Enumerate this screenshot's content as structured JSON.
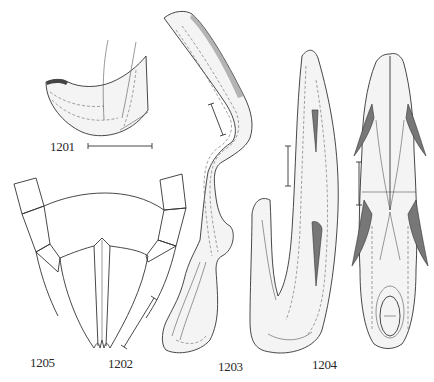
{
  "figure": {
    "type": "scientific-illustration-plate",
    "panels": [
      {
        "id": "1201",
        "label": "1201"
      },
      {
        "id": "1202",
        "label": "1202"
      },
      {
        "id": "1203",
        "label": "1203"
      },
      {
        "id": "1204",
        "label": "1204"
      },
      {
        "id": "1205",
        "label": "1205"
      }
    ],
    "colors": {
      "background": "#ffffff",
      "ink": "#333333"
    }
  }
}
